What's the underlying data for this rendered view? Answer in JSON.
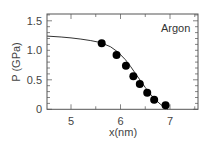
{
  "chart_data": {
    "type": "scatter",
    "title": "",
    "annotation": "Argon",
    "xlabel": "x(nm)",
    "ylabel": "P (GPa)",
    "xlim": [
      4.52,
      7.57
    ],
    "ylim": [
      0,
      1.63
    ],
    "xticks": [
      5,
      6,
      7
    ],
    "xtick_labels": [
      "5",
      "6",
      "7"
    ],
    "yticks": [
      0,
      0.5,
      1.0,
      1.5
    ],
    "ytick_labels": [
      "0",
      "0.5",
      "1.0",
      "1.5"
    ],
    "grid": false,
    "legend": null,
    "series": [
      {
        "name": "simulation points",
        "kind": "scatter",
        "marker": "filled-circle",
        "color": "#000000",
        "x": [
          5.62,
          5.92,
          6.11,
          6.26,
          6.39,
          6.54,
          6.68,
          6.91
        ],
        "y": [
          1.12,
          0.92,
          0.74,
          0.56,
          0.43,
          0.28,
          0.16,
          0.07
        ]
      },
      {
        "name": "fit curve",
        "kind": "line",
        "color": "#333333",
        "x": [
          4.52,
          4.8,
          5.0,
          5.2,
          5.4,
          5.6,
          5.8,
          5.95,
          6.1,
          6.2,
          6.3,
          6.4,
          6.5,
          6.6,
          6.7,
          6.8,
          6.9,
          6.96
        ],
        "y": [
          1.24,
          1.225,
          1.21,
          1.19,
          1.165,
          1.13,
          1.06,
          0.97,
          0.84,
          0.73,
          0.61,
          0.49,
          0.37,
          0.26,
          0.17,
          0.09,
          0.03,
          0.0
        ]
      }
    ]
  }
}
